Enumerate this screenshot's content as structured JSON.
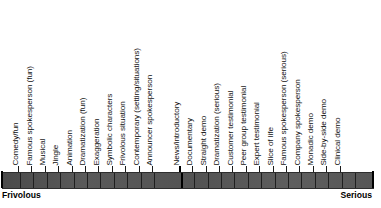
{
  "figure": {
    "name": "frivolous-serious-execution-style-scale",
    "orientation": "horizontal",
    "anchors": {
      "left_label": "Frivolous",
      "right_label": "Serious"
    },
    "bar": {
      "fill_color": "#555555",
      "tick_color": "#1f1f1f",
      "end_cap_color": "#000000"
    }
  },
  "chart_data": {
    "type": "bar",
    "title": "",
    "subtitle": "",
    "xlabel": "",
    "ylabel": "",
    "grid": false,
    "legend": "none",
    "axis_range": [
      "Frivolous",
      "Serious"
    ],
    "categories": [
      "Comedy/fun",
      "Famous spokesperson (fun)",
      "Musical",
      "Jingle",
      "Animation",
      "Dramatization (fun)",
      "Exaggeration",
      "Symbolic characters",
      "Frivolous situation",
      "Contemporary (setting/situations)",
      "Announcer spokesperson",
      "News/introductory",
      "Documentary",
      "Straight demo",
      "Dramatization (serious)",
      "Customer testimonial",
      "Peer group testimonial",
      "Expert testimonial",
      "Slice of life",
      "Famous spokesperson (serious)",
      "Company spokesperson",
      "Monadic demo",
      "Side-by-side demo",
      "Clinical demo"
    ],
    "values": [
      1,
      2,
      3,
      4,
      5,
      6,
      7,
      8,
      9,
      10,
      11,
      12,
      13,
      14,
      15,
      16,
      17,
      18,
      19,
      20,
      21,
      22,
      23,
      24
    ],
    "major_tick_indices": [
      11
    ],
    "tick_positions_px": [
      18,
      31.4,
      44.8,
      58.2,
      71.6,
      85,
      98.4,
      111.8,
      125.2,
      138.6,
      152,
      178.8,
      192.2,
      205.6,
      219,
      232.4,
      245.8,
      259.2,
      272.6,
      286,
      299.4,
      312.8,
      326.2,
      339.6,
      353,
      371
    ]
  }
}
